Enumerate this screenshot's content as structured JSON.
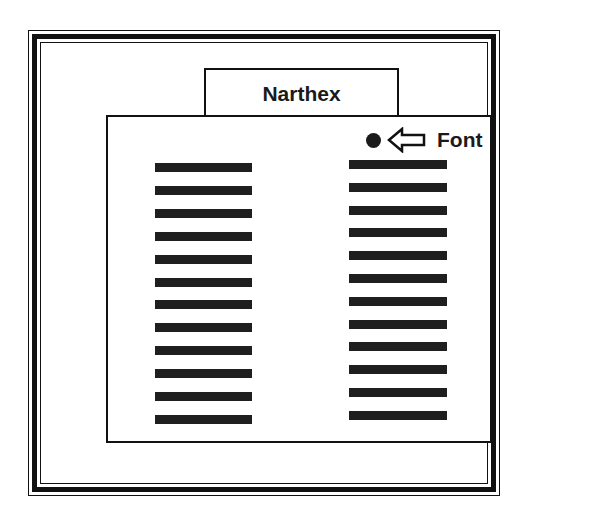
{
  "diagram": {
    "tab_label": "Narthex",
    "pointer": {
      "bullet_icon": "filled-circle",
      "arrow_icon": "left-arrow-outline",
      "label": "Font"
    },
    "columns": [
      {
        "name": "left",
        "bar_count": 12
      },
      {
        "name": "right",
        "bar_count": 12
      }
    ],
    "colors": {
      "ink": "#111111",
      "background": "#ffffff",
      "bar": "#1f1f1f"
    }
  }
}
